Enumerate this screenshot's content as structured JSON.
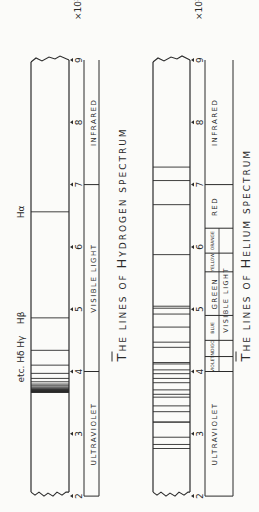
{
  "hydrogen": {
    "title": "The Lines of Hydrogen Spectrum",
    "title_parts": [
      "T",
      "HE LINES OF ",
      "H",
      "YDROGEN SPECTRUM"
    ],
    "line_labels": [
      {
        "text": "Hα",
        "wavelength": 6563
      },
      {
        "text": "Hβ",
        "wavelength": 4861
      },
      {
        "text": "etc. Hδ Hγ",
        "wavelength": 4200
      }
    ],
    "lines": [
      6563,
      4861,
      4340,
      4102,
      3970,
      3889,
      3835,
      3798,
      3771,
      3750,
      3734,
      3722,
      3712,
      3704,
      3697,
      3692,
      3687,
      3683,
      3679,
      3676,
      3673,
      3670,
      3668,
      3666
    ],
    "regions": [
      {
        "label": "ULTRAVIOLET",
        "from": 2000,
        "to": 4000
      },
      {
        "label": "VISIBLE LIGHT",
        "from": 4000,
        "to": 7000
      },
      {
        "label": "INFRARED",
        "from": 7000,
        "to": 9000
      }
    ]
  },
  "helium": {
    "title": "The Lines of Helium Spectrum",
    "title_parts": [
      "T",
      "HE LINES OF ",
      "H",
      "ELIUM SPECTRUM"
    ],
    "lines": [
      7281,
      7065,
      6678,
      5876,
      5048,
      5016,
      4922,
      4713,
      4471,
      4388,
      4144,
      4121,
      4026,
      3965,
      3889,
      3820,
      3705,
      3634,
      3588,
      3448,
      3355,
      3188,
      3188,
      2945,
      2829,
      2764
    ],
    "regions": [
      {
        "label": "ULTRAVIOLET",
        "from": 2000,
        "to": 4000
      },
      {
        "label": "VIOLET",
        "from": 4000,
        "to": 4240
      },
      {
        "label": "INDIGO",
        "from": 4240,
        "to": 4500
      },
      {
        "label": "BLUE",
        "from": 4500,
        "to": 4900
      },
      {
        "label": "GREEN",
        "from": 4900,
        "to": 5600
      },
      {
        "label": "YELLOW",
        "from": 5600,
        "to": 5900
      },
      {
        "label": "ORANGE",
        "from": 5900,
        "to": 6300
      },
      {
        "label": "RED",
        "from": 6300,
        "to": 7000
      },
      {
        "label": "INFRARED",
        "from": 7000,
        "to": 9000
      }
    ],
    "visible_label": "VISIBLE LIGHT"
  },
  "axis": {
    "ticks": [
      "2",
      "3",
      "4",
      "5",
      "6",
      "7",
      "8",
      "9"
    ],
    "unit": "×10³ Å",
    "min": 2000,
    "max": 9000
  }
}
